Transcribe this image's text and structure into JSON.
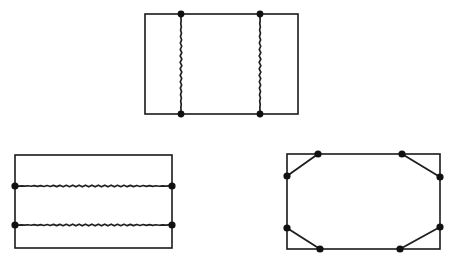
{
  "document": {
    "title": "Three rectangle diagrams with marked boundary points",
    "background_color": "#ffffff",
    "line_color": "#1a1a1a",
    "dot_color": "#111111",
    "canvas": {
      "width": 452,
      "height": 265
    }
  },
  "figures": [
    {
      "id": "top-figure",
      "name": "rectangle-with-two-vertical-chords",
      "label": "",
      "rect": {
        "x": 145,
        "y": 14,
        "width": 153,
        "height": 100
      },
      "chord_style": "wavy",
      "chord_orientation": "vertical",
      "chords": [
        {
          "name": "vertical-chord-left",
          "position": 181,
          "from": [
            181,
            14
          ],
          "to": [
            181,
            114
          ]
        },
        {
          "name": "vertical-chord-right",
          "position": 260,
          "from": [
            260,
            14
          ],
          "to": [
            260,
            114
          ]
        }
      ],
      "dots": [
        {
          "name": "dot-top-left-chord",
          "x": 181,
          "y": 14,
          "r": 3.4
        },
        {
          "name": "dot-top-right-chord",
          "x": 260,
          "y": 14,
          "r": 3.4
        },
        {
          "name": "dot-bottom-left-chord",
          "x": 181,
          "y": 114,
          "r": 3.4
        },
        {
          "name": "dot-bottom-right-chord",
          "x": 260,
          "y": 114,
          "r": 3.4
        }
      ]
    },
    {
      "id": "bottom-left-figure",
      "name": "rectangle-with-two-horizontal-chords",
      "label": "",
      "rect": {
        "x": 15,
        "y": 155,
        "width": 157,
        "height": 93
      },
      "chord_style": "wavy",
      "chord_orientation": "horizontal",
      "chords": [
        {
          "name": "horizontal-chord-upper",
          "position": 186,
          "from": [
            15,
            186
          ],
          "to": [
            172,
            186
          ]
        },
        {
          "name": "horizontal-chord-lower",
          "position": 225,
          "from": [
            15,
            225
          ],
          "to": [
            172,
            225
          ]
        }
      ],
      "dots": [
        {
          "name": "dot-left-upper-chord",
          "x": 15,
          "y": 186,
          "r": 3.6
        },
        {
          "name": "dot-right-upper-chord",
          "x": 172,
          "y": 186,
          "r": 3.6
        },
        {
          "name": "dot-left-lower-chord",
          "x": 15,
          "y": 225,
          "r": 3.6
        },
        {
          "name": "dot-right-lower-chord",
          "x": 172,
          "y": 225,
          "r": 3.6
        }
      ]
    },
    {
      "id": "bottom-right-figure",
      "name": "rectangle-with-inscribed-octagon",
      "label": "",
      "rect": {
        "x": 287,
        "y": 154,
        "width": 153,
        "height": 95
      },
      "chord_style": "straight",
      "chord_orientation": "diagonal",
      "chords": [
        {
          "name": "diagonal-chord-top-left",
          "from": [
            287,
            176
          ],
          "to": [
            318,
            154
          ]
        },
        {
          "name": "diagonal-chord-top-right",
          "from": [
            402,
            154
          ],
          "to": [
            440,
            177
          ]
        },
        {
          "name": "diagonal-chord-bottom-right",
          "from": [
            440,
            227
          ],
          "to": [
            400,
            249
          ]
        },
        {
          "name": "diagonal-chord-bottom-left",
          "from": [
            320,
            249
          ],
          "to": [
            287,
            228
          ]
        }
      ],
      "dots": [
        {
          "name": "dot-left-upper",
          "x": 287,
          "y": 176,
          "r": 3.6
        },
        {
          "name": "dot-top-left",
          "x": 318,
          "y": 154,
          "r": 3.6
        },
        {
          "name": "dot-top-right",
          "x": 402,
          "y": 154,
          "r": 3.6
        },
        {
          "name": "dot-right-upper",
          "x": 440,
          "y": 177,
          "r": 3.6
        },
        {
          "name": "dot-right-lower",
          "x": 440,
          "y": 227,
          "r": 3.6
        },
        {
          "name": "dot-bottom-right",
          "x": 400,
          "y": 249,
          "r": 3.6
        },
        {
          "name": "dot-bottom-left",
          "x": 320,
          "y": 249,
          "r": 3.6
        },
        {
          "name": "dot-left-lower",
          "x": 287,
          "y": 228,
          "r": 3.6
        }
      ]
    }
  ]
}
